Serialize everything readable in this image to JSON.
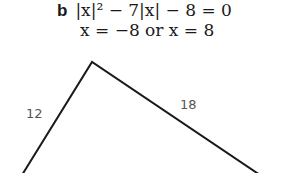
{
  "problem": {
    "label": "b",
    "equation": "|x|² − 7|x| − 8 = 0",
    "solution": "x = −8 or x = 8"
  },
  "figure": {
    "type": "triangle-partial",
    "sides": [
      {
        "label": "12"
      },
      {
        "label": "18"
      }
    ],
    "stroke_color": "#1a1a1a",
    "label_color": "#555555"
  }
}
